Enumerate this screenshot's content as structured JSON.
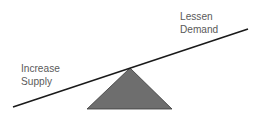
{
  "diagram": {
    "type": "seesaw",
    "labels": {
      "left": [
        "Increase",
        "Supply"
      ],
      "right": [
        "Lessen",
        "Demand"
      ]
    },
    "beam": {
      "x1": 13,
      "y1": 107,
      "x2": 248,
      "y2": 29,
      "color": "#1a1a1a"
    },
    "fulcrum": {
      "apex": [
        130,
        68
      ],
      "base_left": [
        87,
        109
      ],
      "base_right": [
        172,
        109
      ],
      "fill": "#6e6e6e",
      "stroke": "#3a3a3a"
    }
  }
}
